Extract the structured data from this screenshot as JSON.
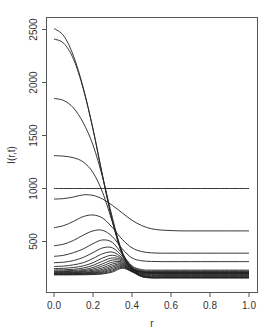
{
  "chart_data": {
    "type": "line",
    "title": "",
    "xlabel": "r",
    "ylabel": "I(r,t)",
    "xlim": [
      -0.04,
      1.04
    ],
    "ylim": [
      150,
      2600
    ],
    "grid": false,
    "legend": null,
    "x_ticks": [
      0.0,
      0.2,
      0.4,
      0.6,
      0.8,
      1.0
    ],
    "x_tick_labels": [
      "0.0",
      "0.2",
      "0.4",
      "0.6",
      "0.8",
      "1.0"
    ],
    "y_ticks": [
      500,
      1000,
      1500,
      2000,
      2500
    ],
    "y_tick_labels": [
      "500",
      "1000",
      "1500",
      "2000",
      "2500"
    ],
    "x": [
      0.0,
      0.05,
      0.1,
      0.15,
      0.2,
      0.25,
      0.3,
      0.35,
      0.4,
      0.45,
      0.5,
      0.55,
      0.6,
      0.65,
      0.7,
      0.75,
      0.8,
      0.85,
      0.9,
      0.95,
      1.0
    ],
    "series": [
      {
        "name": "t1",
        "values": [
          2510,
          2440,
          2250,
          1950,
          1560,
          1110,
          690,
          380,
          240,
          215,
          210,
          210,
          210,
          210,
          210,
          210,
          210,
          210,
          210,
          210,
          210
        ]
      },
      {
        "name": "t2",
        "values": [
          2410,
          2370,
          2220,
          1940,
          1560,
          1110,
          690,
          380,
          240,
          212,
          205,
          205,
          205,
          205,
          205,
          205,
          205,
          205,
          205,
          205,
          205
        ]
      },
      {
        "name": "t3",
        "values": [
          1850,
          1830,
          1760,
          1620,
          1410,
          1100,
          720,
          400,
          250,
          215,
          200,
          200,
          200,
          200,
          200,
          200,
          200,
          200,
          200,
          200,
          200
        ]
      },
      {
        "name": "t4",
        "values": [
          1310,
          1305,
          1290,
          1250,
          1150,
          960,
          680,
          400,
          255,
          215,
          198,
          195,
          195,
          195,
          195,
          195,
          195,
          195,
          195,
          195,
          195
        ]
      },
      {
        "name": "t0",
        "values": [
          1000,
          1000,
          1000,
          1000,
          1000,
          1000,
          1000,
          1000,
          1000,
          1000,
          1000,
          1000,
          1000,
          1000,
          1000,
          1000,
          1000,
          1000,
          1000,
          1000,
          1000
        ]
      },
      {
        "name": "t5",
        "values": [
          900,
          905,
          920,
          940,
          935,
          900,
          840,
          770,
          700,
          650,
          620,
          608,
          603,
          600,
          600,
          600,
          600,
          600,
          600,
          600,
          600
        ]
      },
      {
        "name": "t6",
        "values": [
          630,
          650,
          690,
          735,
          750,
          720,
          630,
          520,
          440,
          405,
          393,
          390,
          390,
          390,
          390,
          390,
          390,
          390,
          390,
          390,
          390
        ]
      },
      {
        "name": "t7",
        "values": [
          460,
          475,
          510,
          560,
          600,
          605,
          545,
          430,
          345,
          318,
          312,
          310,
          310,
          310,
          310,
          310,
          310,
          310,
          310,
          310,
          310
        ]
      },
      {
        "name": "t8",
        "values": [
          360,
          370,
          395,
          430,
          480,
          515,
          490,
          380,
          270,
          235,
          230,
          230,
          230,
          230,
          230,
          230,
          230,
          230,
          230,
          230,
          230
        ]
      },
      {
        "name": "t9",
        "values": [
          300,
          305,
          320,
          350,
          395,
          440,
          440,
          360,
          260,
          225,
          222,
          222,
          222,
          222,
          222,
          222,
          222,
          222,
          222,
          222,
          222
        ]
      },
      {
        "name": "t10",
        "values": [
          265,
          268,
          280,
          300,
          340,
          385,
          400,
          345,
          250,
          218,
          215,
          215,
          215,
          215,
          215,
          215,
          215,
          215,
          215,
          215,
          215
        ]
      },
      {
        "name": "t11",
        "values": [
          245,
          247,
          255,
          270,
          300,
          345,
          370,
          335,
          245,
          212,
          208,
          208,
          208,
          208,
          208,
          208,
          208,
          208,
          208,
          208,
          208
        ]
      },
      {
        "name": "t12",
        "values": [
          232,
          233,
          238,
          250,
          275,
          315,
          345,
          325,
          240,
          205,
          200,
          200,
          200,
          200,
          200,
          200,
          200,
          200,
          200,
          200,
          200
        ]
      },
      {
        "name": "t13",
        "values": [
          222,
          223,
          227,
          235,
          255,
          290,
          325,
          315,
          235,
          200,
          193,
          193,
          193,
          193,
          193,
          193,
          193,
          193,
          193,
          193,
          193
        ]
      },
      {
        "name": "t14",
        "values": [
          215,
          216,
          219,
          225,
          240,
          270,
          305,
          305,
          232,
          195,
          186,
          186,
          186,
          186,
          186,
          186,
          186,
          186,
          186,
          186,
          186
        ]
      },
      {
        "name": "t15",
        "values": [
          210,
          210,
          212,
          217,
          228,
          252,
          288,
          296,
          228,
          190,
          180,
          180,
          180,
          180,
          180,
          180,
          180,
          180,
          180,
          180,
          180
        ]
      },
      {
        "name": "t16",
        "values": [
          205,
          205,
          207,
          210,
          218,
          238,
          272,
          288,
          225,
          185,
          174,
          174,
          174,
          174,
          174,
          174,
          174,
          174,
          174,
          174,
          174
        ]
      },
      {
        "name": "t17",
        "values": [
          200,
          200,
          201,
          204,
          210,
          226,
          258,
          280,
          222,
          180,
          168,
          168,
          168,
          168,
          168,
          168,
          168,
          168,
          168,
          168,
          168
        ]
      },
      {
        "name": "t18",
        "values": [
          196,
          196,
          197,
          199,
          204,
          216,
          245,
          272,
          220,
          176,
          163,
          163,
          163,
          163,
          163,
          163,
          163,
          163,
          163,
          163,
          163
        ]
      },
      {
        "name": "t19",
        "values": [
          192,
          192,
          193,
          195,
          199,
          208,
          233,
          264,
          218,
          172,
          160,
          160,
          160,
          160,
          160,
          160,
          160,
          160,
          160,
          160,
          160
        ]
      },
      {
        "name": "t20",
        "values": [
          188,
          188,
          189,
          190,
          193,
          200,
          222,
          256,
          216,
          170,
          158,
          158,
          158,
          158,
          158,
          158,
          158,
          158,
          158,
          158,
          158
        ]
      },
      {
        "name": "t21",
        "values": [
          185,
          185,
          185,
          186,
          188,
          194,
          212,
          248,
          214,
          168,
          156,
          156,
          156,
          156,
          156,
          156,
          156,
          156,
          156,
          156,
          156
        ]
      }
    ],
    "style": {
      "line_color": "#222222",
      "axis_color": "#555555",
      "background": "#ffffff"
    }
  }
}
